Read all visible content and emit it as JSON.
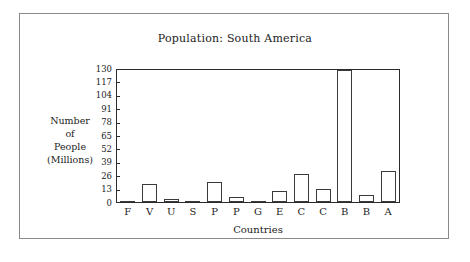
{
  "frame": {
    "border_color": "#8a8a8a",
    "background": "#ffffff"
  },
  "chart_data": {
    "type": "bar",
    "title": "Population: South America",
    "xlabel": "Countries",
    "ylabel": "Number of People (Millions)",
    "ylabel_lines": [
      "Number",
      "of",
      "People",
      "(Millions)"
    ],
    "categories": [
      "F",
      "V",
      "U",
      "S",
      "P",
      "P",
      "G",
      "E",
      "C",
      "C",
      "B",
      "B",
      "A"
    ],
    "values": [
      0,
      18,
      3,
      0,
      20,
      5,
      1,
      11,
      28,
      13,
      130,
      7,
      31
    ],
    "ylim": [
      0,
      130
    ],
    "yticks": [
      0,
      13,
      26,
      39,
      52,
      65,
      78,
      91,
      104,
      117,
      130
    ],
    "ytick_labels": [
      "0",
      "13",
      "26",
      "39",
      "52",
      "65",
      "78",
      "91",
      "104",
      "117",
      "130"
    ],
    "grid": false,
    "legend": null,
    "bar_fill": "#ffffff",
    "bar_edge": "#3a3a3a",
    "axis_color": "#2b2b2b"
  }
}
